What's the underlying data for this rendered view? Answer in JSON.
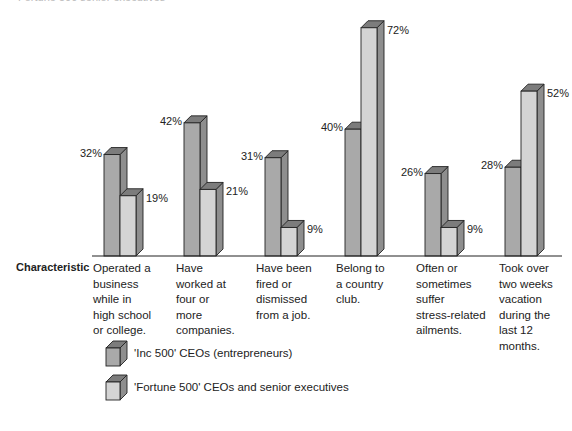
{
  "title": "Fortune 500 senior executives",
  "characteristic_label": "Characteristic",
  "chart_data": {
    "type": "bar",
    "title": "",
    "xlabel": "Characteristic",
    "ylabel": "",
    "ylim": [
      0,
      80
    ],
    "grid": false,
    "legend_position": "bottom-left",
    "categories": [
      "Operated a business while in high school or college.",
      "Have worked at four or more companies.",
      "Have been fired or dismissed from a job.",
      "Belong to a country club.",
      "Often or sometimes suffer stress-related ailments.",
      "Took over two weeks vacation during the last 12 months."
    ],
    "series": [
      {
        "name": "'Inc 500' CEOs (entrepreneurs)",
        "color": "#a9a9a9",
        "values": [
          32,
          42,
          31,
          40,
          26,
          28
        ]
      },
      {
        "name": "'Fortune 500' CEOs and senior executives",
        "color": "#d4d4d4",
        "values": [
          19,
          21,
          9,
          72,
          9,
          52
        ]
      }
    ],
    "value_labels": [
      [
        "32%",
        "19%"
      ],
      [
        "42%",
        "21%"
      ],
      [
        "31%",
        "9%"
      ],
      [
        "40%",
        "72%"
      ],
      [
        "26%",
        "9%"
      ],
      [
        "28%",
        "52%"
      ]
    ]
  },
  "category_lines": [
    [
      "Operated a",
      "business",
      "while  in",
      "high school",
      "or college."
    ],
    [
      "Have",
      "worked at",
      "four or",
      "more",
      "companies."
    ],
    [
      "Have been",
      "fired or",
      "dismissed",
      "from a job."
    ],
    [
      "Belong to",
      "a country",
      "club."
    ],
    [
      "Often or",
      "sometimes",
      "suffer",
      "stress-related",
      "ailments."
    ],
    [
      "Took over",
      "two weeks",
      "vacation",
      "during the",
      "last 12",
      "months."
    ]
  ],
  "legend": [
    {
      "label": "'Inc 500' CEOs (entrepreneurs)",
      "color": "#a9a9a9"
    },
    {
      "label": "'Fortune 500' CEOs and senior executives",
      "color": "#d4d4d4"
    }
  ]
}
